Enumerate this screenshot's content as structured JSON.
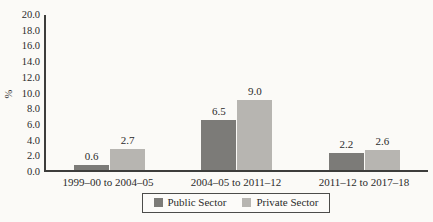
{
  "chart_data": {
    "type": "bar",
    "title": "",
    "xlabel": "",
    "ylabel": "%",
    "ylim": [
      0,
      20
    ],
    "ytick_step": 2,
    "ytick_format_decimals": 1,
    "grid": false,
    "value_labels": true,
    "legend_position": "bottom",
    "categories": [
      "1999–00 to 2004–05",
      "2004–05 to 2011–12",
      "2011–12 to 2017–18"
    ],
    "series": [
      {
        "name": "Public Sector",
        "color": "#7c7b78",
        "values": [
          0.6,
          6.5,
          2.2
        ]
      },
      {
        "name": "Private Sector",
        "color": "#b7b5b1",
        "values": [
          2.7,
          9.0,
          2.6
        ]
      }
    ]
  }
}
